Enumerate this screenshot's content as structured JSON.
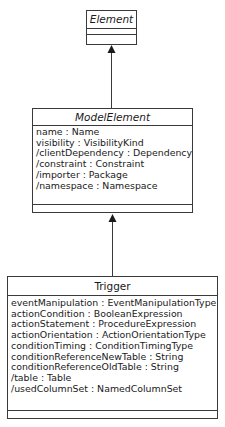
{
  "diagram": {
    "type": "UML class diagram",
    "classes": [
      {
        "name": "Element",
        "abstract": true,
        "attributes": [],
        "operations": []
      },
      {
        "name": "ModelElement",
        "abstract": true,
        "attributes": [
          "name : Name",
          "visibility : VisibilityKind",
          "/clientDependency : Dependency",
          "/constraint : Constraint",
          "/importer : Package",
          "/namespace : Namespace"
        ],
        "operations": []
      },
      {
        "name": "Trigger",
        "abstract": false,
        "attributes": [
          "eventManipulation : EventManipulationType",
          "actionCondition : BooleanExpression",
          "actionStatement : ProcedureExpression",
          "actionOrientation : ActionOrientationType",
          "conditionTiming : ConditionTimingType",
          "conditionReferenceNewTable : String",
          "conditionReferenceOldTable : String",
          "/table : Table",
          "/usedColumnSet : NamedColumnSet"
        ],
        "operations": []
      }
    ],
    "relationships": [
      {
        "type": "generalization",
        "from": "ModelElement",
        "to": "Element"
      },
      {
        "type": "generalization",
        "from": "Trigger",
        "to": "ModelElement"
      }
    ],
    "colors": {
      "line": "#3a3a3a",
      "background": "#ffffff",
      "text": "#1a1a1a"
    }
  }
}
